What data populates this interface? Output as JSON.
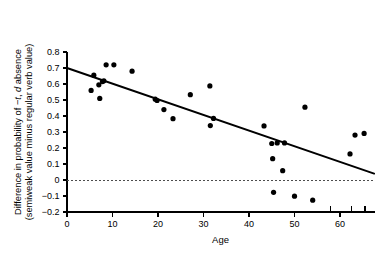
{
  "chart_data": {
    "type": "scatter",
    "title": "",
    "xlabel": "Age",
    "ylabel_line1": "Difference in probability of −t, d absence",
    "ylabel_line2": "(semiweak value minus regular verb value)",
    "ylabel": "Difference in probability of −t, d absence (semiweak value minus regular verb value)",
    "xlim": [
      0,
      67.5
    ],
    "ylim": [
      -0.2,
      0.8
    ],
    "grid": false,
    "legend": null,
    "x_ticks": [
      0,
      10,
      20,
      30,
      40,
      50,
      60
    ],
    "x_tick_labels": [
      "0",
      "10",
      "20",
      "30",
      "40",
      "50",
      "60"
    ],
    "x_extra_ticks": [
      58,
      62.5,
      65.5
    ],
    "y_ticks": [
      -0.2,
      -0.1,
      0,
      0.1,
      0.2,
      0.3,
      0.4,
      0.5,
      0.6,
      0.7,
      0.8
    ],
    "y_tick_labels": [
      "−0.2",
      "−0.1",
      "0",
      "0.1",
      "0.2",
      "0.3",
      "0.4",
      "0.5",
      "0.6",
      "0.7",
      "0.8"
    ],
    "zero_reference_line": {
      "y": 0,
      "style": "dotted"
    },
    "fit_line": {
      "label": "regression line",
      "x_start": 0,
      "y_start": 0.7,
      "x_end": 67.5,
      "y_end": 0.04
    },
    "marker": {
      "shape": "circle",
      "color": "#000000",
      "size_px": 5.2
    },
    "points": [
      {
        "x": 5.3,
        "y": 0.56
      },
      {
        "x": 5.9,
        "y": 0.655
      },
      {
        "x": 7.0,
        "y": 0.595
      },
      {
        "x": 7.2,
        "y": 0.51
      },
      {
        "x": 7.8,
        "y": 0.615
      },
      {
        "x": 8.1,
        "y": 0.62
      },
      {
        "x": 8.6,
        "y": 0.72
      },
      {
        "x": 10.3,
        "y": 0.72
      },
      {
        "x": 14.3,
        "y": 0.68
      },
      {
        "x": 19.4,
        "y": 0.505
      },
      {
        "x": 19.8,
        "y": 0.497
      },
      {
        "x": 21.3,
        "y": 0.44
      },
      {
        "x": 23.3,
        "y": 0.383
      },
      {
        "x": 27.1,
        "y": 0.533
      },
      {
        "x": 31.4,
        "y": 0.588
      },
      {
        "x": 31.5,
        "y": 0.34
      },
      {
        "x": 32.2,
        "y": 0.385
      },
      {
        "x": 43.3,
        "y": 0.338
      },
      {
        "x": 45.0,
        "y": 0.228
      },
      {
        "x": 45.2,
        "y": 0.133
      },
      {
        "x": 45.4,
        "y": -0.077
      },
      {
        "x": 46.2,
        "y": 0.232
      },
      {
        "x": 47.4,
        "y": 0.058
      },
      {
        "x": 47.8,
        "y": 0.232
      },
      {
        "x": 50.0,
        "y": -0.101
      },
      {
        "x": 52.3,
        "y": 0.455
      },
      {
        "x": 54.0,
        "y": -0.126
      },
      {
        "x": 62.2,
        "y": 0.163
      },
      {
        "x": 63.3,
        "y": 0.281
      },
      {
        "x": 65.3,
        "y": 0.291
      }
    ]
  }
}
